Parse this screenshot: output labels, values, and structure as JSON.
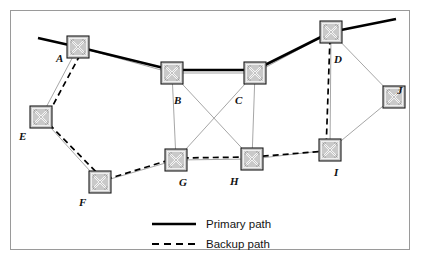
{
  "figure": {
    "type": "network-topology-diagram",
    "title": "",
    "canvas": {
      "width": 437,
      "height": 265
    },
    "frame": {
      "x": 10,
      "y": 10,
      "width": 400,
      "height": 240,
      "border_color": "#9a9a9a",
      "background": "#ffffff"
    }
  },
  "style": {
    "link_color": "#9c9c9c",
    "link_width": 0.9,
    "primary_color": "#000000",
    "primary_width": 2.6,
    "backup_color": "#000000",
    "backup_width": 1.7,
    "backup_dash": "6,4",
    "node_fill": "#c9c9c9",
    "node_stroke": "#1a1a1a",
    "node_inner": "#f2f2f2",
    "label_color": "#111111"
  },
  "nodes": [
    {
      "id": "A",
      "label": "A",
      "x": 78,
      "y": 47,
      "label_dx": -22,
      "label_dy": 6
    },
    {
      "id": "B",
      "label": "B",
      "x": 172,
      "y": 73,
      "label_dx": 2,
      "label_dy": 22
    },
    {
      "id": "C",
      "label": "C",
      "x": 255,
      "y": 73,
      "label_dx": -20,
      "label_dy": 22
    },
    {
      "id": "D",
      "label": "D",
      "x": 331,
      "y": 32,
      "label_dx": 3,
      "label_dy": 22
    },
    {
      "id": "E",
      "label": "E",
      "x": 41,
      "y": 117,
      "label_dx": -22,
      "label_dy": 14
    },
    {
      "id": "F",
      "label": "F",
      "x": 100,
      "y": 182,
      "label_dx": -21,
      "label_dy": 15
    },
    {
      "id": "G",
      "label": "G",
      "x": 176,
      "y": 160,
      "label_dx": 3,
      "label_dy": 17
    },
    {
      "id": "H",
      "label": "H",
      "x": 252,
      "y": 159,
      "label_dx": -22,
      "label_dy": 17
    },
    {
      "id": "I",
      "label": "I",
      "x": 330,
      "y": 150,
      "label_dx": 4,
      "label_dy": 17
    },
    {
      "id": "J",
      "label": "J",
      "x": 394,
      "y": 97,
      "label_dx": 3,
      "label_dy": -12
    }
  ],
  "node_icon": {
    "name": "network-switch-icon",
    "size": 22
  },
  "links": [
    {
      "from": "A",
      "to": "B"
    },
    {
      "from": "A",
      "to": "E"
    },
    {
      "from": "E",
      "to": "F"
    },
    {
      "from": "F",
      "to": "G"
    },
    {
      "from": "B",
      "to": "C"
    },
    {
      "from": "B",
      "to": "G"
    },
    {
      "from": "B",
      "to": "H"
    },
    {
      "from": "C",
      "to": "G"
    },
    {
      "from": "C",
      "to": "H"
    },
    {
      "from": "C",
      "to": "D"
    },
    {
      "from": "G",
      "to": "H"
    },
    {
      "from": "H",
      "to": "I"
    },
    {
      "from": "I",
      "to": "D"
    },
    {
      "from": "I",
      "to": "J"
    },
    {
      "from": "D",
      "to": "J"
    }
  ],
  "paths": {
    "primary": {
      "name": "Primary path",
      "style": "solid",
      "route": [
        "edge-left",
        "A",
        "B",
        "C",
        "D",
        "edge-right"
      ],
      "points": [
        [
          38,
          38
        ],
        [
          78,
          47
        ],
        [
          172,
          70
        ],
        [
          255,
          70
        ],
        [
          331,
          32
        ],
        [
          396,
          19
        ]
      ]
    },
    "backup": {
      "name": "Backup path",
      "style": "dashed",
      "route": [
        "A",
        "E",
        "F",
        "G",
        "H",
        "I",
        "D"
      ],
      "points": [
        [
          80,
          55
        ],
        [
          45,
          120
        ],
        [
          104,
          180
        ],
        [
          176,
          158
        ],
        [
          252,
          157
        ],
        [
          326,
          151
        ],
        [
          330,
          38
        ]
      ]
    }
  },
  "legend": {
    "items": [
      {
        "id": "primary",
        "label": "Primary path",
        "style": "solid",
        "swatch": "primary-path-line"
      },
      {
        "id": "backup",
        "label": "Backup path",
        "style": "dashed",
        "swatch": "backup-path-line"
      }
    ],
    "layout": {
      "line_x1": 152,
      "line_x2": 196,
      "label_x": 206,
      "primary_y": 224,
      "backup_y": 244
    }
  }
}
